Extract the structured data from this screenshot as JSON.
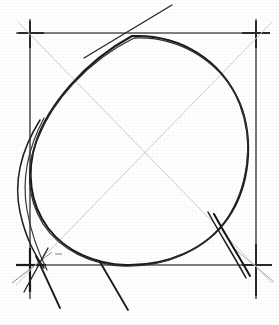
{
  "canvas": {
    "width": 279,
    "height": 325,
    "background_color": "#ffffff",
    "title": "Egg shape construction drawing"
  },
  "palette": {
    "ink_dark": "#1a1a1a",
    "ink_medium": "#3a3a3a",
    "guide_gray": "#b9b9b9",
    "guide_light_gray": "#d2d2d2",
    "border_gray": "#555555"
  },
  "square_frame": {
    "label": "bounding square",
    "left": 30,
    "top": 33,
    "right": 256,
    "bottom": 265,
    "stroke_color": "#555555",
    "stroke_width": 1.6,
    "overshoot": 14
  },
  "corner_marks": [
    {
      "name": "corner-mark-top-left",
      "x": 30,
      "y": 33
    },
    {
      "name": "corner-mark-top-right",
      "x": 256,
      "y": 33
    },
    {
      "name": "corner-mark-bottom-left",
      "x": 30,
      "y": 265
    },
    {
      "name": "corner-mark-bottom-right",
      "x": 256,
      "y": 265
    }
  ],
  "diagonals": [
    {
      "name": "diagonal-tl-br",
      "x1": 18,
      "y1": 22,
      "x2": 272,
      "y2": 283,
      "stroke_color": "#cfcfcf",
      "stroke_width": 1.0
    },
    {
      "name": "diagonal-bl-tr",
      "x1": 16,
      "y1": 285,
      "x2": 272,
      "y2": 22,
      "stroke_color": "#cfcfcf",
      "stroke_width": 1.0
    }
  ],
  "egg_outline": {
    "name": "egg-contour",
    "description": "Large egg / oval shape, wide rounded top, tapering toward lower-left",
    "stroke_color": "#1a1a1a",
    "stroke_width": 2.0,
    "path": "M 132 36 C 180 34 222 60 240 104 C 254 140 250 186 228 218 C 206 250 166 266 126 265 C 96 264 66 252 48 228 C 30 204 26 172 36 142 C 48 106 84 62 132 36 Z"
  },
  "egg_outline_secondary": {
    "name": "egg-contour-secondary-pass",
    "description": "Second lighter freehand pass overlapping the main egg contour",
    "stroke_color": "#2e2e2e",
    "stroke_width": 1.3,
    "path": "M 134 38 C 182 36 224 64 241 106 C 254 142 248 188 226 220 C 203 252 164 267 124 266 C 92 265 60 250 43 224 C 27 198 25 166 38 138 C 52 102 86 62 134 38"
  },
  "construction_strokes": [
    {
      "name": "tangent-stroke-top",
      "description": "Straight tangent stroke crossing the top edge, extending up-right",
      "stroke_color": "#2a2a2a",
      "stroke_width": 1.4,
      "path": "M 84 58 L 172 5"
    },
    {
      "name": "left-bulge-stroke",
      "description": "Outer freehand arc bulging past the left border of the square",
      "stroke_color": "#1f1f1f",
      "stroke_width": 1.5,
      "path": "M 40 120 C 20 152 14 184 20 212 C 26 240 36 256 44 268"
    },
    {
      "name": "left-bulge-stroke-inner",
      "description": "Inner companion arc near the left border",
      "stroke_color": "#353535",
      "stroke_width": 1.2,
      "path": "M 44 118 C 27 150 22 182 27 210 C 32 238 40 256 47 270"
    },
    {
      "name": "right-tail-stroke",
      "description": "Dark straight construction stroke from the egg's right flank down past the bottom-right corner",
      "stroke_color": "#151515",
      "stroke_width": 2.0,
      "path": "M 214 214 C 226 236 240 258 250 276"
    },
    {
      "name": "right-tail-stroke-tip",
      "description": "Short continuation of the right tail below the bottom edge",
      "stroke_color": "#1f1f1f",
      "stroke_width": 1.5,
      "path": "M 208 212 C 220 234 234 256 246 278"
    },
    {
      "name": "bottom-tick-center",
      "description": "Short tick descending below the bottom edge near the egg's base",
      "stroke_color": "#1a1a1a",
      "stroke_width": 1.8,
      "path": "M 100 262 L 128 310"
    },
    {
      "name": "bottom-tick-left",
      "description": "Short tick descending below the bottom-left corner",
      "stroke_color": "#1a1a1a",
      "stroke_width": 1.8,
      "path": "M 36 256 L 60 308"
    },
    {
      "name": "bottom-tick-left-outer",
      "description": "Crossing stroke through the bottom-left corner",
      "stroke_color": "#2a2a2a",
      "stroke_width": 1.4,
      "path": "M 48 248 L 24 292"
    },
    {
      "name": "corner-cross-stroke-bl",
      "description": "Light diagonal passing through the bottom-left cross",
      "stroke_color": "#8d8d8d",
      "stroke_width": 1.0,
      "path": "M 12 283 L 52 252"
    },
    {
      "name": "corner-cross-stroke-br",
      "description": "Light diagonal passing through the bottom-right cross",
      "stroke_color": "#b0b0b0",
      "stroke_width": 1.0,
      "path": "M 236 250 L 274 282"
    }
  ],
  "smudges": [
    {
      "name": "smudge-bottom-left-interior",
      "x": 55,
      "y": 253,
      "width": 7,
      "height": 2
    }
  ]
}
